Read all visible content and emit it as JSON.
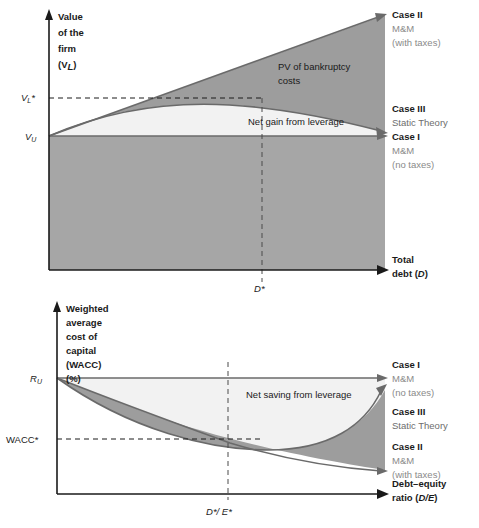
{
  "figure": {
    "type": "diagram"
  },
  "top_chart": {
    "yaxis": {
      "lines": [
        "Value",
        "of the",
        "firm",
        "(V",
        "L",
        ")"
      ],
      "label_l1": "Value",
      "label_l2": "of the",
      "label_l3": "firm",
      "label_l4_pre": "(V",
      "label_l4_sub": "L",
      "label_l4_post": ")"
    },
    "xaxis": {
      "label_l1": "Total",
      "label_l2_pre": "debt (",
      "label_l2_it": "D",
      "label_l2_post": ")"
    },
    "ticks": {
      "y_upper_pre": "V",
      "y_upper_sub": "L",
      "y_upper_post": "*",
      "y_lower_pre": "V",
      "y_lower_sub": "U",
      "x_star_pre": "D",
      "x_star_post": "*"
    },
    "annotations": {
      "bankruptcy_l1": "PV of bankruptcy",
      "bankruptcy_l2": "costs",
      "net_gain": "Net gain from leverage"
    },
    "legend": [
      {
        "title": "Case II",
        "line1": "M&M",
        "line2": "(with taxes)"
      },
      {
        "title": "Case III",
        "line1": "Static Theory",
        "line2": ""
      },
      {
        "title": "Case I",
        "line1": "M&M",
        "line2": "(no taxes)"
      }
    ]
  },
  "bottom_chart": {
    "yaxis": {
      "label_l1": "Weighted",
      "label_l2": "average",
      "label_l3": "cost of",
      "label_l4": "capital",
      "label_l5": "(WACC)",
      "label_l6": "(%)"
    },
    "xaxis": {
      "label_l1": "Debt–equity",
      "label_l2_pre": "ratio (",
      "label_l2_it": "D/E",
      "label_l2_post": ")"
    },
    "ticks": {
      "y_upper_pre": "R",
      "y_upper_sub": "U",
      "y_lower": "WACC*",
      "x_star_pre": "D",
      "x_star_mid": "*/ E",
      "x_star_post": "*"
    },
    "annotations": {
      "net_saving": "Net saving from leverage"
    },
    "legend": [
      {
        "title": "Case I",
        "line1": "M&M",
        "line2": "(no taxes)"
      },
      {
        "title": "Case III",
        "line1": "Static Theory",
        "line2": ""
      },
      {
        "title": "Case II",
        "line1": "M&M",
        "line2": "(with taxes)"
      }
    ]
  },
  "colors": {
    "axis": "#1a1a1a",
    "mid_gray": "#9d9d9d",
    "dark_gray": "#a6a6a6",
    "light_gray": "#f2f2f2",
    "curve": "#6a6a6a",
    "legend_gray": "#8a8a8a"
  }
}
